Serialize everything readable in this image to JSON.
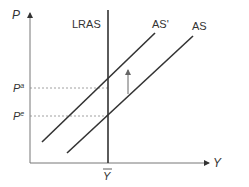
{
  "diagram": {
    "type": "economics-as-shift",
    "axes": {
      "y_label": "P",
      "x_label": "Y"
    },
    "curves": {
      "lras": {
        "label": "LRAS"
      },
      "as_shifted": {
        "label": "AS'"
      },
      "as_original": {
        "label": "AS"
      }
    },
    "price_levels": {
      "upper": {
        "base": "P",
        "sup": "a"
      },
      "lower": {
        "base": "P",
        "sup": "e"
      }
    },
    "output_level": {
      "label": "Y",
      "bar": true
    },
    "shift_arrow": {
      "direction": "up"
    },
    "colors": {
      "line": "#333333",
      "axis": "#777777",
      "dashed": "#888888",
      "arrow": "#666666"
    }
  }
}
